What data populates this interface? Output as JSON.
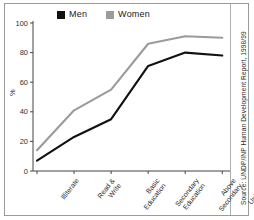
{
  "figure": {
    "source_note": "Source: UNDP/INP Human Development Report, 1998/99"
  },
  "legend": {
    "items": [
      {
        "label": "Men",
        "color": "#111111",
        "swatch": "men-swatch"
      },
      {
        "label": "Women",
        "color": "#9b9b9b",
        "swatch": "women-swatch"
      }
    ]
  },
  "chart_data": {
    "type": "line",
    "title": "",
    "subtitle": "",
    "xlabel": "",
    "ylabel": "%",
    "ylim": [
      0,
      100
    ],
    "yticks": [
      0,
      20,
      40,
      60,
      80,
      100
    ],
    "ytick_labels": [
      "0",
      "20",
      "40",
      "60",
      "80",
      "100"
    ],
    "grid": false,
    "legend_position": "top",
    "categories": [
      "Illiterate",
      "Read & Write",
      "Basic Education",
      "Secondary Education",
      "Above Secondary",
      "University"
    ],
    "category_lines": [
      [
        "Illiterate"
      ],
      [
        "Read &",
        "Write"
      ],
      [
        "Basic",
        "Education"
      ],
      [
        "Secondary",
        "Education"
      ],
      [
        "Above",
        "Secondary"
      ],
      [
        "University"
      ]
    ],
    "series": [
      {
        "name": "Men",
        "color": "#111111",
        "values": [
          7,
          23,
          35,
          71,
          80,
          78
        ]
      },
      {
        "name": "Women",
        "color": "#9b9b9b",
        "values": [
          14,
          41,
          55,
          86,
          91,
          90
        ]
      }
    ]
  }
}
